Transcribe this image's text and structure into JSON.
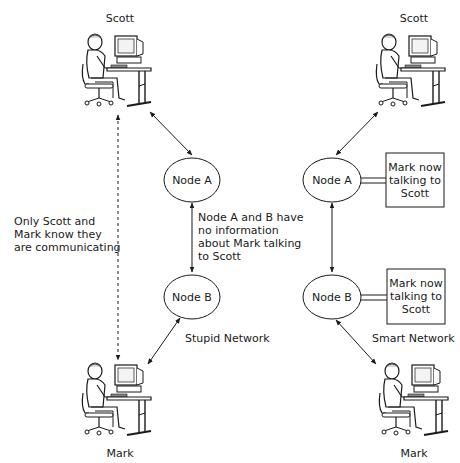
{
  "left": {
    "top_user": "Scott",
    "bottom_user": "Mark",
    "node_a": "Node A",
    "node_b": "Node B",
    "side_note": "Only Scott and\nMark know they\nare communicating",
    "middle_note": "Node A and B have\nno information\nabout Mark talking\nto Scott",
    "network_label": "Stupid Network"
  },
  "right": {
    "top_user": "Scott",
    "bottom_user": "Mark",
    "node_a": "Node A",
    "node_b": "Node B",
    "state_box_a": "Mark now\ntalking to\nScott",
    "state_box_b": "Mark now\ntalking to\nScott",
    "network_label": "Smart Network"
  },
  "colors": {
    "line": "#1a1a1a",
    "background": "#ffffff"
  }
}
